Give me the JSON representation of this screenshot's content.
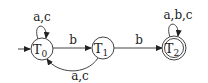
{
  "diagram": {
    "type": "finite-automaton",
    "states": [
      {
        "id": "T0",
        "name": "T",
        "sub": "0",
        "initial": true,
        "accepting": false
      },
      {
        "id": "T1",
        "name": "T",
        "sub": "1",
        "initial": false,
        "accepting": false
      },
      {
        "id": "T2",
        "name": "T",
        "sub": "2",
        "initial": false,
        "accepting": true
      }
    ],
    "transitions": [
      {
        "from": "T0",
        "to": "T0",
        "label": "a,c"
      },
      {
        "from": "T0",
        "to": "T1",
        "label": "b"
      },
      {
        "from": "T1",
        "to": "T0",
        "label": "a,c"
      },
      {
        "from": "T1",
        "to": "T2",
        "label": "b"
      },
      {
        "from": "T2",
        "to": "T2",
        "label": "a,b,c"
      }
    ]
  }
}
